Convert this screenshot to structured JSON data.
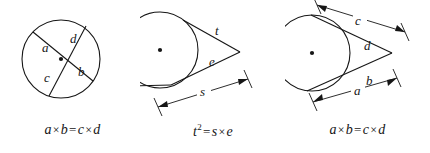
{
  "page": {
    "background_color": "#ffffff",
    "ink_color": "#161616",
    "width": 430,
    "height": 153
  },
  "figures": [
    {
      "id": "figure-1",
      "name": "intersecting-chords",
      "caption": "Two chords intersecting inside a circle",
      "center_dot": true,
      "segment_labels": [
        {
          "text": "a",
          "x": 46,
          "y": 47
        },
        {
          "text": "d",
          "x": 73,
          "y": 38
        },
        {
          "text": "c",
          "x": 48,
          "y": 76
        },
        {
          "text": "b",
          "x": 80,
          "y": 69
        }
      ],
      "formula": {
        "left1": "a",
        "op1": "×",
        "left2": "b",
        "eq": "=",
        "right1": "c",
        "op2": "×",
        "right2": "d"
      }
    },
    {
      "id": "figure-2",
      "name": "tangent-secant",
      "caption": "Tangent and secant from an external point",
      "center_dot": true,
      "segment_labels": [
        {
          "text": "t",
          "x": 218,
          "y": 42
        },
        {
          "text": "e",
          "x": 212,
          "y": 72
        },
        {
          "text": "s",
          "x": 203,
          "y": 108
        }
      ],
      "formula": {
        "left1": "t",
        "exponent": "2",
        "eq": "=",
        "right1": "s",
        "op2": "×",
        "right2": "e"
      }
    },
    {
      "id": "figure-3",
      "name": "two-secants",
      "caption": "Two secants from an external point",
      "center_dot": true,
      "segment_labels": [
        {
          "text": "c",
          "x": 360,
          "y": 25
        },
        {
          "text": "d",
          "x": 368,
          "y": 47
        },
        {
          "text": "b",
          "x": 370,
          "y": 83
        },
        {
          "text": "a",
          "x": 358,
          "y": 104
        }
      ],
      "formula": {
        "left1": "a",
        "op1": "×",
        "left2": "b",
        "eq": "=",
        "right1": "c",
        "op2": "×",
        "right2": "d"
      }
    }
  ]
}
